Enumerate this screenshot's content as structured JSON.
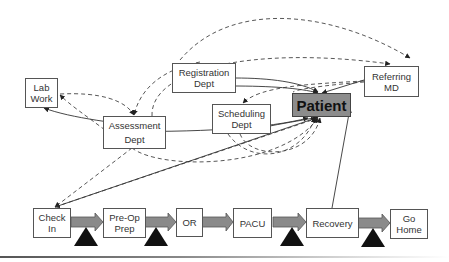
{
  "diagram": {
    "departments": {
      "lab_work": "Lab\nWork",
      "assessment": "Assessment\nDept",
      "registration": "Registration\nDept",
      "scheduling": "Scheduling\nDept",
      "patient": "Patient",
      "referring_md": "Referring\nMD"
    },
    "process_steps": [
      {
        "id": "check_in",
        "label": "Check\nIn"
      },
      {
        "id": "pre_op",
        "label": "Pre-Op\nPrep"
      },
      {
        "id": "or",
        "label": "OR"
      },
      {
        "id": "pacu",
        "label": "PACU"
      },
      {
        "id": "recovery",
        "label": "Recovery"
      },
      {
        "id": "go_home",
        "label": "Go\nHome"
      }
    ],
    "colors": {
      "patient_fill": "#8c8c8c",
      "arrow_fill": "#8a8a8a",
      "wait_triangle": "#111111",
      "line": "#333333"
    },
    "legend_note": "solid lines = information flow; dashed lines = communication"
  }
}
